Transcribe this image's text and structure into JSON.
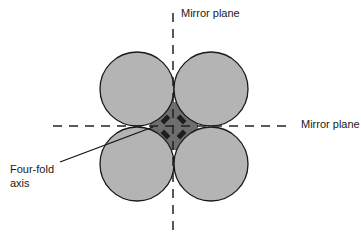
{
  "diagram": {
    "type": "four-fold symmetry of close-packed spheres",
    "labels": {
      "vertical_plane": "Mirror plane",
      "horizontal_plane": "Mirror plane",
      "axis_line1": "Four-fold",
      "axis_line2": "axis"
    },
    "colors": {
      "circle_fill": "#b4b4b4",
      "circle_stroke": "#1a1a1a",
      "interstice_fill": "#6e6e6e",
      "symbol_fill": "#1e1e1e",
      "dash_color": "#222222"
    },
    "circles": [
      {
        "name": "top-left",
        "cx": 137,
        "cy": 89,
        "r": 37
      },
      {
        "name": "top-right",
        "cx": 211,
        "cy": 89,
        "r": 37
      },
      {
        "name": "bottom-left",
        "cx": 137,
        "cy": 164,
        "r": 37
      },
      {
        "name": "bottom-right",
        "cx": 211,
        "cy": 164,
        "r": 37
      }
    ]
  }
}
